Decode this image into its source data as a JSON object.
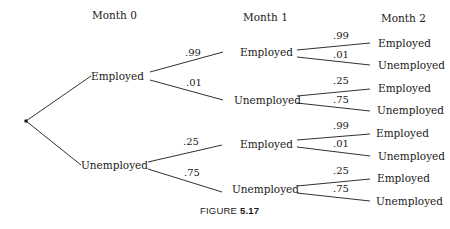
{
  "headers": {
    "month0": "Month 0",
    "month1": "Month 1",
    "month2": "Month 2"
  },
  "tree": {
    "month0": [
      {
        "state": "Employed"
      },
      {
        "state": "Unemployed"
      }
    ],
    "month1": [
      {
        "from": "Employed",
        "state": "Employed",
        "prob": ".99"
      },
      {
        "from": "Employed",
        "state": "Unemployed",
        "prob": ".01"
      },
      {
        "from": "Unemployed",
        "state": "Employed",
        "prob": ".25"
      },
      {
        "from": "Unemployed",
        "state": "Unemployed",
        "prob": ".75"
      }
    ],
    "month2": [
      {
        "from": "Employed",
        "state": "Employed",
        "prob": ".99"
      },
      {
        "from": "Employed",
        "state": "Unemployed",
        "prob": ".01"
      },
      {
        "from": "Unemployed",
        "state": "Employed",
        "prob": ".25"
      },
      {
        "from": "Unemployed",
        "state": "Unemployed",
        "prob": ".75"
      },
      {
        "from": "Employed",
        "state": "Employed",
        "prob": ".99"
      },
      {
        "from": "Employed",
        "state": "Unemployed",
        "prob": ".01"
      },
      {
        "from": "Unemployed",
        "state": "Employed",
        "prob": ".25"
      },
      {
        "from": "Unemployed",
        "state": "Unemployed",
        "prob": ".75"
      }
    ]
  },
  "caption": {
    "prefix": "FIGURE ",
    "number": "5.17"
  },
  "colors": {
    "line": "#1a1a1a",
    "background": "#ffffff"
  }
}
